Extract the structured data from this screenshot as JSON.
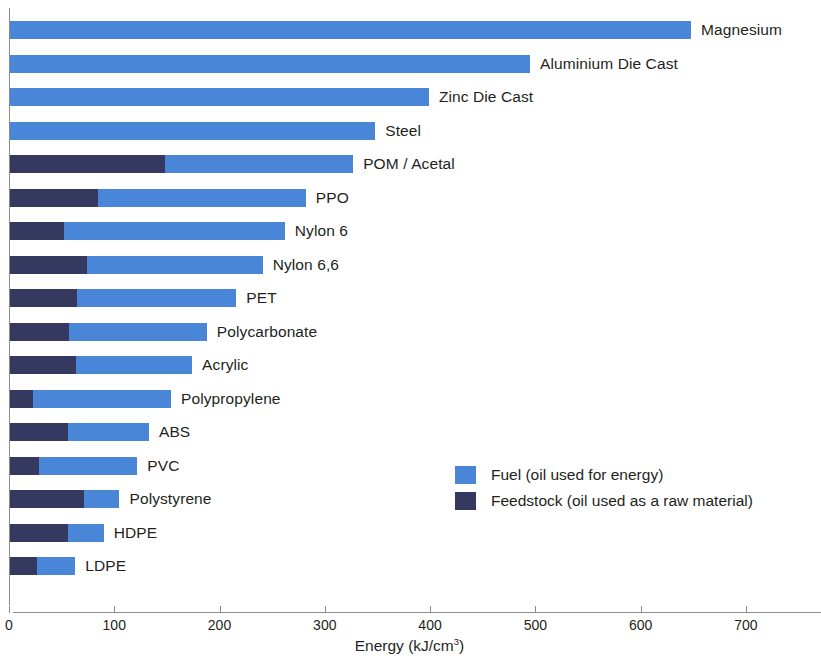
{
  "chart_data": {
    "type": "bar",
    "orientation": "horizontal",
    "stacked": true,
    "title": "",
    "xlabel": "Energy (kJ/cm3)",
    "xlabel_display": "Energy (kJ/cm",
    "xlabel_sup": "3",
    "xlabel_tail": ")",
    "ylabel": "",
    "xlim": [
      0,
      760
    ],
    "xticks": [
      0,
      100,
      200,
      300,
      400,
      500,
      600,
      700
    ],
    "xtick_labels": [
      "0",
      "100",
      "200",
      "300",
      "400",
      "500",
      "600",
      "700"
    ],
    "grid": false,
    "legend_position": "middle-right-inside",
    "categories": [
      "Magnesium",
      "Aluminium Die Cast",
      "Zinc Die Cast",
      "Steel",
      "POM / Acetal",
      "PPO",
      "Nylon 6",
      "Nylon 6,6",
      "PET",
      "Polycarbonate",
      "Acrylic",
      "Polypropylene",
      "ABS",
      "PVC",
      "Polystyrene",
      "HDPE",
      "LDPE"
    ],
    "series": [
      {
        "name": "Feedstock (oil used as a raw material)",
        "color": "#35395f",
        "values": [
          0,
          0,
          0,
          0,
          147,
          84,
          51,
          73,
          64,
          56,
          63,
          22,
          55,
          28,
          70,
          55,
          26
        ]
      },
      {
        "name": "Fuel (oil used for energy)",
        "color": "#4a86d8",
        "values": [
          647,
          494,
          398,
          347,
          179,
          197,
          210,
          167,
          151,
          131,
          110,
          131,
          77,
          93,
          34,
          34,
          36
        ]
      }
    ],
    "totals": [
      647,
      494,
      398,
      347,
      326,
      281,
      261,
      240,
      215,
      187,
      173,
      153,
      132,
      121,
      104,
      89,
      62
    ]
  },
  "legend": {
    "items": [
      {
        "label": "Fuel (oil used for energy)",
        "color": "#4a86d8"
      },
      {
        "label": "Feedstock (oil used as a raw material)",
        "color": "#35395f"
      }
    ]
  },
  "colors": {
    "fuel": "#4a86d8",
    "feedstock": "#35395f",
    "axis": "#8b8b8b",
    "text": "#231f20",
    "background": "#ffffff"
  }
}
